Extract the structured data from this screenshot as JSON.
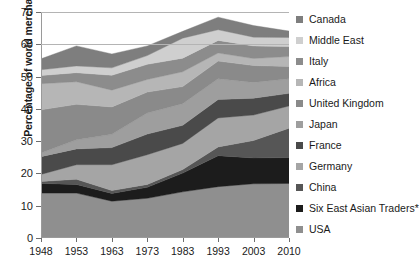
{
  "chart_data": {
    "type": "area",
    "title": "",
    "xlabel": "",
    "ylabel": "Percentage of world merchandise imports",
    "categories": [
      "1948",
      "1953",
      "1963",
      "1973",
      "1983",
      "1993",
      "2003",
      "2010"
    ],
    "ylim": [
      0,
      70
    ],
    "yticks": [
      0,
      10,
      20,
      30,
      40,
      50,
      60,
      70
    ],
    "gridlines": [
      60,
      70
    ],
    "grid": true,
    "legend_position": "right",
    "stacked": true,
    "stack_order_bottom_to_top": [
      "USA",
      "Six East Asian Traders*",
      "China",
      "Germany",
      "France",
      "Japan",
      "United Kingdom",
      "Africa",
      "Italy",
      "Middle East",
      "Canada"
    ],
    "totals": [
      55.5,
      59.5,
      57.0,
      59.5,
      64.0,
      68.5,
      66.0,
      64.0
    ],
    "series": [
      {
        "name": "USA",
        "color": "#8f8f8f",
        "values": [
          13.9,
          13.9,
          11.4,
          12.3,
          14.3,
          15.9,
          16.8,
          16.9
        ]
      },
      {
        "name": "Six East Asian Traders*",
        "color": "#1c1c1c",
        "values": [
          3.0,
          2.7,
          2.4,
          3.4,
          5.8,
          9.6,
          8.0,
          8.0
        ]
      },
      {
        "name": "China",
        "color": "#565656",
        "values": [
          0.6,
          1.6,
          0.9,
          0.9,
          1.1,
          2.7,
          5.4,
          9.1
        ]
      },
      {
        "name": "Germany",
        "color": "#a5a5a5",
        "values": [
          2.2,
          4.5,
          8.0,
          9.2,
          8.1,
          9.0,
          7.9,
          6.9
        ]
      },
      {
        "name": "France",
        "color": "#4a4a4a",
        "values": [
          5.5,
          4.9,
          5.3,
          6.4,
          5.6,
          5.7,
          5.2,
          3.9
        ]
      },
      {
        "name": "Japan",
        "color": "#9e9e9e",
        "values": [
          1.1,
          2.8,
          4.1,
          6.5,
          6.7,
          6.4,
          4.9,
          4.5
        ]
      },
      {
        "name": "United Kingdom",
        "color": "#8a8a8a",
        "values": [
          13.4,
          11.0,
          8.5,
          6.5,
          5.3,
          5.5,
          5.2,
          3.8
        ]
      },
      {
        "name": "Africa",
        "color": "#b6b6b6",
        "values": [
          8.1,
          7.0,
          5.2,
          3.9,
          4.6,
          2.5,
          2.2,
          3.1
        ]
      },
      {
        "name": "Italy",
        "color": "#8c8c8c",
        "values": [
          2.5,
          2.8,
          4.6,
          4.7,
          4.2,
          3.9,
          3.9,
          3.1
        ]
      },
      {
        "name": "Middle East",
        "color": "#cfcfcf",
        "values": [
          1.8,
          2.1,
          2.3,
          2.7,
          6.2,
          3.3,
          2.7,
          2.8
        ]
      },
      {
        "name": "Canada",
        "color": "#7e7e7e",
        "values": [
          3.4,
          6.2,
          4.3,
          3.0,
          2.1,
          3.9,
          3.6,
          2.0
        ]
      }
    ]
  },
  "axes": {
    "y_title": "Percentage of world merchandise imports",
    "y_tick_labels": [
      "70",
      "60",
      "50",
      "40",
      "30",
      "20",
      "10",
      "0"
    ],
    "x_tick_labels": [
      "1948",
      "1953",
      "1963",
      "1973",
      "1983",
      "1993",
      "2003",
      "2010"
    ]
  },
  "legend": {
    "items": [
      {
        "label": "Canada",
        "color": "#7e7e7e"
      },
      {
        "label": "Middle East",
        "color": "#cfcfcf"
      },
      {
        "label": "Italy",
        "color": "#8c8c8c"
      },
      {
        "label": "Africa",
        "color": "#b6b6b6"
      },
      {
        "label": "United Kingdom",
        "color": "#8a8a8a"
      },
      {
        "label": "Japan",
        "color": "#9e9e9e"
      },
      {
        "label": "France",
        "color": "#4a4a4a"
      },
      {
        "label": "Germany",
        "color": "#a5a5a5"
      },
      {
        "label": "China",
        "color": "#565656"
      },
      {
        "label": "Six East Asian Traders*",
        "color": "#1c1c1c"
      },
      {
        "label": "USA",
        "color": "#8f8f8f"
      }
    ]
  }
}
